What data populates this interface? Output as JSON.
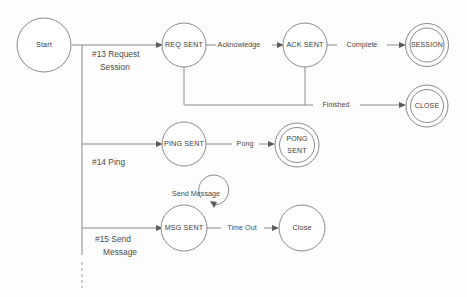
{
  "diagram": {
    "type": "state-diagram",
    "background_color": "#fdfdfd",
    "stroke_color": "#8a8a8a",
    "text_color": "#4a4a4a",
    "nodes": {
      "start": {
        "label": "Start",
        "shape": "circle"
      },
      "req_sent": {
        "label": "REQ SENT",
        "shape": "circle"
      },
      "ack_sent": {
        "label": "ACK SENT",
        "shape": "circle"
      },
      "session": {
        "label": "SESSION",
        "shape": "double-circle"
      },
      "close_final": {
        "label": "CLOSE",
        "shape": "double-circle"
      },
      "ping_sent": {
        "label": "PING SENT",
        "shape": "circle"
      },
      "pong_sent_line1": {
        "label": "PONG",
        "shape": "double-circle"
      },
      "pong_sent_line2": {
        "label": "SENT"
      },
      "msg_sent": {
        "label": "MSG SENT",
        "shape": "circle"
      },
      "close_plain": {
        "label": "Close",
        "shape": "circle"
      }
    },
    "branch_labels": {
      "request_session_line1": "#13 Request",
      "request_session_line2": "Session",
      "ping": "#14 Ping",
      "send_message_line1": "#15 Send",
      "send_message_line2": "Message"
    },
    "edge_labels": {
      "acknowledge": "Acknowledge",
      "complete": "Complete",
      "finished": "Finished",
      "pong": "Pong",
      "send_message_loop": "Send Message",
      "time_out": "Time Out"
    }
  }
}
